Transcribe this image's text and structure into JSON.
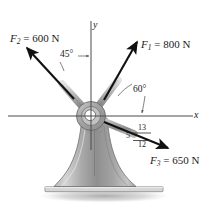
{
  "figure": {
    "background_color": "#ffffff",
    "ink_color": "#1a1a1a"
  },
  "axes": {
    "x_label": "x",
    "y_label": "y",
    "origin": {
      "x": 91,
      "y": 116
    },
    "color": "#4a4a4a"
  },
  "forces": [
    {
      "id": "F1",
      "symbol": "F",
      "subscript": "1",
      "equals": "=",
      "magnitude": "800",
      "unit": "N",
      "full_label": "F1 = 800 N",
      "angle_from_x_axis_deg": 60,
      "direction": "up-right",
      "color": "#111111"
    },
    {
      "id": "F2",
      "symbol": "F",
      "subscript": "2",
      "equals": "=",
      "magnitude": "600",
      "unit": "N",
      "full_label": "F2 = 600 N",
      "angle_from_y_axis_deg": 45,
      "direction": "up-left",
      "color": "#111111"
    },
    {
      "id": "F3",
      "symbol": "F",
      "subscript": "3",
      "equals": "=",
      "magnitude": "650",
      "unit": "N",
      "full_label": "F3 = 650 N",
      "direction": "down-right",
      "color": "#111111"
    }
  ],
  "annotations": {
    "angle_45": "45°",
    "angle_60": "60°",
    "slope_triangle": {
      "hypotenuse": "13",
      "vertical": "5",
      "horizontal": "12"
    }
  },
  "structure": {
    "hub_name": "ring-hub",
    "pedestal_name": "flared-pedestal-column",
    "base_plate_name": "base-plate",
    "shadow_name": "ground-shadow",
    "body_fill_light": "#cfcfcf",
    "body_fill_mid": "#a8a8a8",
    "body_fill_dark": "#8a8a8a",
    "outline_color": "#6b6b6b"
  }
}
